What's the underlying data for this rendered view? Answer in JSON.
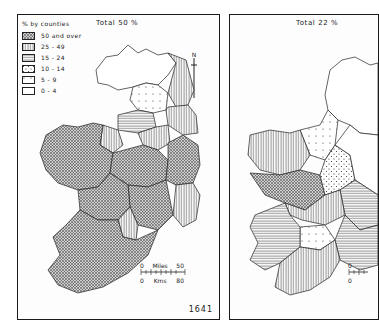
{
  "figure_number": "1641",
  "maps": [
    {
      "title": "Total 50 %",
      "total_percent": 50,
      "north_label": "N",
      "scale": {
        "miles_label": "Miles",
        "miles_start": "0",
        "miles_end": "50",
        "kms_label": "Kms",
        "kms_start": "0",
        "kms_end": "80"
      }
    },
    {
      "title": "Total 22 %",
      "total_percent": 22,
      "scale": {
        "miles_start": "0",
        "kms_start": "0"
      }
    }
  ],
  "legend": {
    "heading": "% by counties",
    "classes": [
      {
        "label": "50 and over",
        "pattern": "crosshatch-dense"
      },
      {
        "label": "25 - 49",
        "pattern": "vertical-lines"
      },
      {
        "label": "15 - 24",
        "pattern": "horizontal-lines"
      },
      {
        "label": "10 - 14",
        "pattern": "dots-dense"
      },
      {
        "label": "5 - 9",
        "pattern": "dots-sparse"
      },
      {
        "label": "0 - 4",
        "pattern": "blank"
      }
    ]
  },
  "colors": {
    "ink": "#1a1a1a",
    "paper": "#ffffff"
  }
}
